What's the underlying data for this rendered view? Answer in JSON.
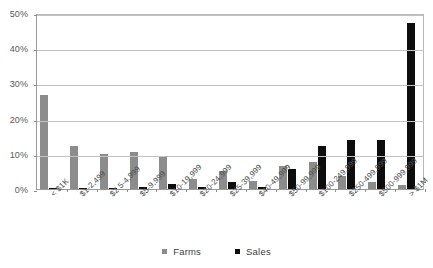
{
  "chart_data": {
    "type": "bar",
    "title": "",
    "subtitle": "",
    "xlabel": "",
    "ylabel": "",
    "ylim": [
      0,
      50
    ],
    "ytick_labels": [
      "0%",
      "10%",
      "20%",
      "30%",
      "40%",
      "50%"
    ],
    "ytick_values": [
      0,
      10,
      20,
      30,
      40,
      50
    ],
    "grid": true,
    "legend_position": "bottom",
    "categories": [
      "< $1K",
      "$1-2,499",
      "$2.5-4,999",
      "$5-9,999",
      "$10-19,999",
      "$20-24,999",
      "$25-39,999",
      "$40-49,999",
      "$50-99,999",
      "$100-249,999",
      "$250-499,999",
      "$500-999,999",
      "> $1M"
    ],
    "series": [
      {
        "name": "Farms",
        "color": "#8c8c8c",
        "values": [
          26.8,
          12.1,
          9.9,
          10.5,
          9.2,
          2.8,
          5.2,
          2.4,
          6.5,
          7.8,
          3.8,
          2.0,
          1.2
        ]
      },
      {
        "name": "Sales",
        "color": "#0d0d0d",
        "values": [
          0.05,
          0.25,
          0.4,
          0.7,
          1.4,
          0.5,
          1.9,
          0.7,
          5.6,
          12.1,
          13.9,
          13.9,
          47.2
        ]
      }
    ]
  },
  "legend": {
    "items": [
      {
        "label": "Farms",
        "color": "#8c8c8c",
        "swatch_icon": "square-swatch-icon"
      },
      {
        "label": "Sales",
        "color": "#0d0d0d",
        "swatch_icon": "square-swatch-icon"
      }
    ]
  },
  "colors": {
    "farms": "#8c8c8c",
    "sales": "#0d0d0d",
    "gridline": "#c2c2c2",
    "axis": "#9a9a9a",
    "text": "#4d4d4f",
    "background": "#ffffff"
  }
}
